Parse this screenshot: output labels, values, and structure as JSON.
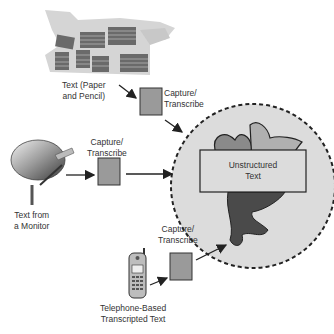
{
  "diagram": {
    "sources": {
      "paper": {
        "label_line1": "Text (Paper",
        "label_line2": "and Pencil)"
      },
      "monitor": {
        "label_line1": "Text from",
        "label_line2": "a Monitor"
      },
      "telephone": {
        "label_line1": "Telephone-Based",
        "label_line2": "Transcripted Text"
      }
    },
    "process": {
      "top": {
        "line1": "Capture/",
        "line2": "Transcribe"
      },
      "middle": {
        "line1": "Capture/",
        "line2": "Transcribe"
      },
      "bottom": {
        "line1": "Capture/",
        "line2": "Transcribe"
      }
    },
    "target": {
      "line1": "Unstructured",
      "line2": "Text"
    },
    "colors": {
      "box_fill": "#9a9a9a",
      "circle_fill": "#dcdcdc",
      "blob_light": "#a8a8a8",
      "blob_dark": "#4a4a4a"
    }
  }
}
